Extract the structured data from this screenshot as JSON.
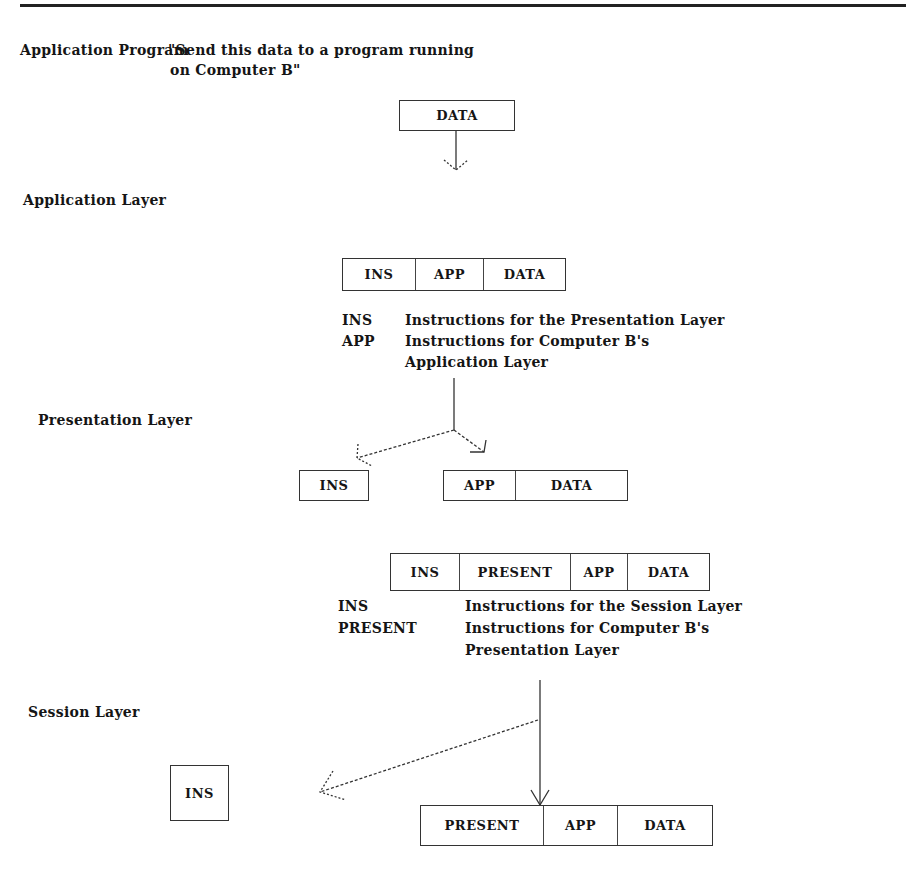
{
  "rule": true,
  "labels": {
    "application_program": "Application Program",
    "quote_line1": "\"Send this data to a program running",
    "quote_line2": "on Computer B\"",
    "application_layer": "Application Layer",
    "presentation_layer": "Presentation Layer",
    "session_layer": "Session Layer"
  },
  "boxes": {
    "data_only": [
      "DATA"
    ],
    "app_layer_packet": [
      "INS",
      "APP",
      "DATA"
    ],
    "pres_split_ins": [
      "INS"
    ],
    "pres_split_rest": [
      "APP",
      "DATA"
    ],
    "pres_layer_packet": [
      "INS",
      "PRESENT",
      "APP",
      "DATA"
    ],
    "sess_split_ins": [
      "INS"
    ],
    "sess_split_rest": [
      "PRESENT",
      "APP",
      "DATA"
    ]
  },
  "legend1": [
    {
      "key": "INS",
      "text": "Instructions for the Presentation Layer"
    },
    {
      "key": "APP",
      "text": "Instructions for Computer B's"
    },
    {
      "key": "",
      "text": "Application Layer"
    }
  ],
  "legend2": [
    {
      "key": "INS",
      "text": "Instructions for the Session Layer"
    },
    {
      "key": "PRESENT",
      "text": "Instructions for Computer B's"
    },
    {
      "key": "",
      "text": "Presentation Layer"
    }
  ]
}
